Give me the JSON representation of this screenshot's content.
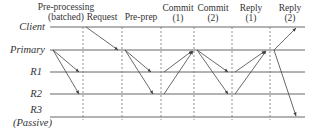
{
  "nodes": [
    {
      "id": "client",
      "label": "Client",
      "y": 27
    },
    {
      "id": "primary",
      "label": "Primary",
      "y": 50
    },
    {
      "id": "r1",
      "label": "R1",
      "y": 72
    },
    {
      "id": "r2",
      "label": "R2",
      "y": 94
    },
    {
      "id": "r3",
      "label": "R3",
      "sublabel": "(Passive)",
      "y": 117
    }
  ],
  "phases": [
    {
      "line1": "Pre-processing",
      "line2": "(batched)",
      "cx": 66
    },
    {
      "line1": "Request",
      "line2": "",
      "cx": 102
    },
    {
      "line1": "Pre-prep",
      "line2": "",
      "cx": 141
    },
    {
      "line1": "Commit",
      "line2": "(1)",
      "cx": 178
    },
    {
      "line1": "Commit",
      "line2": "(2)",
      "cx": 213
    },
    {
      "line1": "Reply",
      "line2": "(1)",
      "cx": 251
    },
    {
      "line1": "Reply",
      "line2": "(2)",
      "cx": 290
    }
  ],
  "dividers_x": [
    83,
    122,
    161,
    194,
    232,
    270
  ],
  "colors": {
    "line": "#555555",
    "dashed": "#777777",
    "text": "#333333"
  }
}
